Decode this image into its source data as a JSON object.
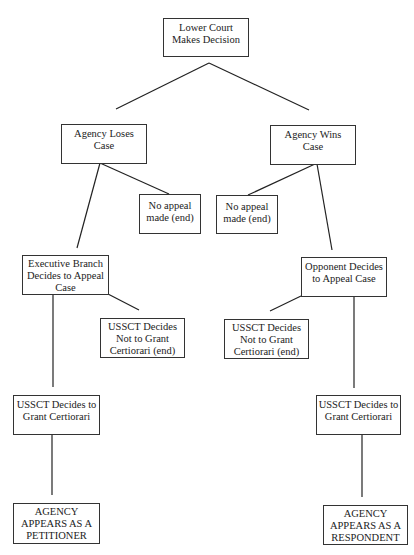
{
  "diagram": {
    "type": "decision-tree",
    "nodes": {
      "root": "Lower Court\nMakes Decision",
      "agency_loses": "Agency Loses\nCase",
      "agency_wins": "Agency Wins\nCase",
      "no_appeal_left": "No appeal\nmade (end)",
      "no_appeal_right": "No appeal\nmade (end)",
      "exec_appeal": "Executive Branch\nDecides to Appeal\nCase",
      "opponent_appeal": "Opponent Decides\nto Appeal Case",
      "deny_cert_left": "USSCT Decides\nNot to Grant\nCertiorari (end)",
      "deny_cert_right": "USSCT Decides\nNot to Grant\nCertiorari (end)",
      "grant_cert_left": "USSCT Decides to\nGrant Certiorari",
      "grant_cert_right": "USSCT Decides to\nGrant Certiorari",
      "petitioner": "AGENCY\nAPPEARS AS A\nPETITIONER",
      "respondent": "AGENCY\nAPPEARS AS A\nRESPONDENT"
    },
    "edges": [
      [
        "root",
        "agency_loses"
      ],
      [
        "root",
        "agency_wins"
      ],
      [
        "agency_loses",
        "exec_appeal"
      ],
      [
        "agency_loses",
        "no_appeal_left"
      ],
      [
        "agency_wins",
        "no_appeal_right"
      ],
      [
        "agency_wins",
        "opponent_appeal"
      ],
      [
        "exec_appeal",
        "deny_cert_left"
      ],
      [
        "exec_appeal",
        "grant_cert_left"
      ],
      [
        "opponent_appeal",
        "deny_cert_right"
      ],
      [
        "opponent_appeal",
        "grant_cert_right"
      ],
      [
        "grant_cert_left",
        "petitioner"
      ],
      [
        "grant_cert_right",
        "respondent"
      ]
    ]
  }
}
